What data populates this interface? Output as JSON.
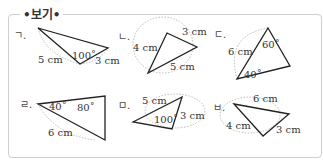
{
  "title": "•보기•",
  "items": [
    {
      "label": "ㄱ.",
      "texts": [
        "5 cm",
        "100˚",
        "3 cm"
      ]
    },
    {
      "label": "ㄴ.",
      "texts": [
        "4 cm",
        "3 cm",
        "5 cm"
      ]
    },
    {
      "label": "ㄷ.",
      "texts": [
        "6 cm",
        "60˚",
        "40˚"
      ]
    },
    {
      "label": "ㄹ.",
      "texts": [
        "40˚",
        "80˚",
        "6 cm"
      ]
    },
    {
      "label": "ㅁ.",
      "texts": [
        "5 cm",
        "100˚",
        "3 cm"
      ]
    },
    {
      "label": "ㅂ.",
      "texts": [
        "6 cm",
        "4 cm",
        "3 cm"
      ]
    }
  ]
}
